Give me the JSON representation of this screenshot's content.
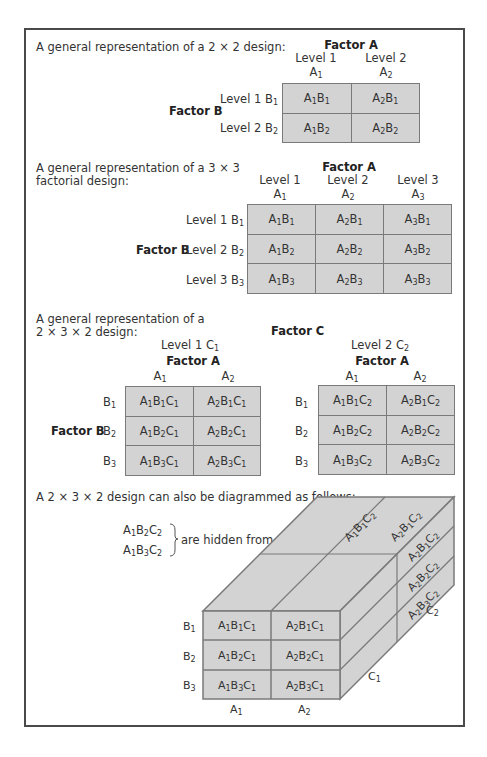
{
  "section1": {
    "title": "A general representation of a 2 × 2 design:",
    "factor_a": "Factor A",
    "factor_b": "Factor B",
    "col_levels": [
      {
        "level": "Level 1",
        "sym": "A",
        "sub": "1"
      },
      {
        "level": "Level 2",
        "sym": "A",
        "sub": "2"
      }
    ],
    "row_levels": [
      {
        "level": "Level 1 B",
        "sub": "1"
      },
      {
        "level": "Level 2 B",
        "sub": "2"
      }
    ],
    "cells": [
      [
        {
          "a": "1",
          "b": "1"
        },
        {
          "a": "2",
          "b": "1"
        }
      ],
      [
        {
          "a": "1",
          "b": "2"
        },
        {
          "a": "2",
          "b": "2"
        }
      ]
    ]
  },
  "section2": {
    "title_line1": "A general representation of a 3 × 3",
    "title_line2": "factorial design:",
    "factor_a": "Factor A",
    "factor_b": "Factor B",
    "col_levels": [
      {
        "level": "Level 1",
        "sub": "1"
      },
      {
        "level": "Level 2",
        "sub": "2"
      },
      {
        "level": "Level 3",
        "sub": "3"
      }
    ],
    "row_levels": [
      {
        "level": "Level 1 B",
        "sub": "1"
      },
      {
        "level": "Level 2 B",
        "sub": "2"
      },
      {
        "level": "Level 3 B",
        "sub": "3"
      }
    ]
  },
  "section3": {
    "title_line1": "A general representation of a",
    "title_line2": "2 × 3 × 2 design:",
    "factor_c": "Factor C",
    "factor_a": "Factor A",
    "factor_b": "Factor B",
    "c_levels": [
      {
        "level": "Level 1 C",
        "sub": "1"
      },
      {
        "level": "Level 2 C",
        "sub": "2"
      }
    ],
    "a_levels": [
      "1",
      "2"
    ],
    "b_levels": [
      "1",
      "2",
      "3"
    ]
  },
  "section4": {
    "title": "A 2 × 3 × 2 design can also be diagrammed as follows:",
    "hidden_cells": [
      "A1B2C2",
      "A1B3C2"
    ],
    "hidden_note": "are hidden from view",
    "front_rows": [
      "B1",
      "B2",
      "B3"
    ],
    "front_cols": [
      "A1",
      "A2"
    ],
    "top_labels": [
      "A1B1C2",
      "A2B1C2"
    ],
    "side_labels": [
      "A2B1C2",
      "A2B2C2",
      "A2B3C2"
    ],
    "depth_labels": [
      "C1",
      "C2"
    ]
  }
}
